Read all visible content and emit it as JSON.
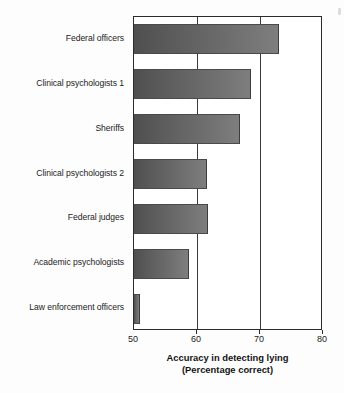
{
  "chart_data": {
    "type": "bar",
    "orientation": "horizontal",
    "title": "",
    "xlabel": "Accuracy in detecting lying",
    "xlabel_sub": "(Percentage correct)",
    "ylabel": "",
    "xlim": [
      50,
      80
    ],
    "xticks": [
      50,
      60,
      70,
      80
    ],
    "xtick_labels": [
      "50",
      "60",
      "70",
      "80"
    ],
    "grid": "vertical gridlines at 60 and 70",
    "gridlines": [
      60,
      70
    ],
    "legend": "none",
    "bar_color_dark": "#4f4f4f",
    "bar_color_light": "#7e7e7e",
    "axis_color": "#2b2b2b",
    "categories": [
      "Federal officers",
      "Clinical psychologists 1",
      "Sheriffs",
      "Clinical psychologists 2",
      "Federal judges",
      "Academic psychologists",
      "Law enforcement officers"
    ],
    "values": [
      73.0,
      68.6,
      66.8,
      61.6,
      61.7,
      58.7,
      51.0
    ]
  }
}
